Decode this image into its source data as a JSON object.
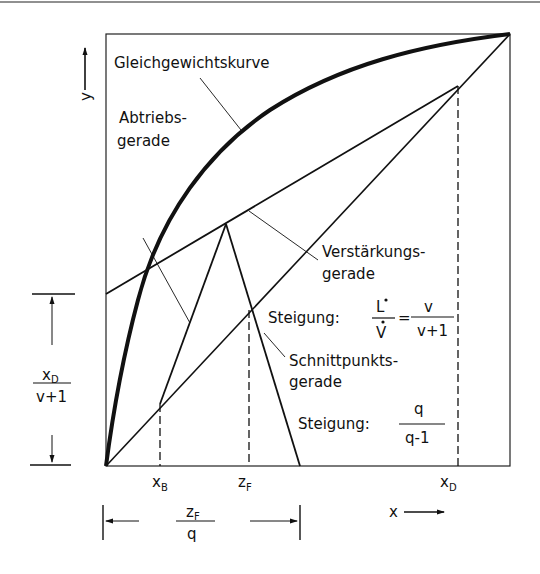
{
  "diagram": {
    "type": "McCabe-Thiele diagram",
    "axes": {
      "x_label": "x",
      "y_label": "y"
    },
    "labels": {
      "equilibrium_curve": "Gleichgewichtskurve",
      "stripping_line_1": "Abtriebs-",
      "stripping_line_2": "gerade",
      "rectifying_line_1": "Verstärkungs-",
      "rectifying_line_2": "gerade",
      "q_line_1": "Schnittpunkts-",
      "q_line_2": "gerade",
      "slope_rect_prefix": "Steigung:",
      "slope_rect_num1": "L",
      "slope_rect_den1": "V",
      "slope_rect_eq": "=",
      "slope_rect_num2": "v",
      "slope_rect_den2": "v+1",
      "slope_q_prefix": "Steigung:",
      "slope_q_num": "q",
      "slope_q_den": "q-1"
    },
    "ticks": {
      "xB_main": "x",
      "xB_sub": "B",
      "zF_main": "z",
      "zF_sub": "F",
      "xD_main": "x",
      "xD_sub": "D"
    },
    "dimensions": {
      "intercept_num_main": "x",
      "intercept_num_sub": "D",
      "intercept_den": "v+1",
      "feed_num_main": "z",
      "feed_num_sub": "F",
      "feed_den": "q"
    },
    "colors": {
      "line": "#111111",
      "background": "#ffffff"
    }
  }
}
